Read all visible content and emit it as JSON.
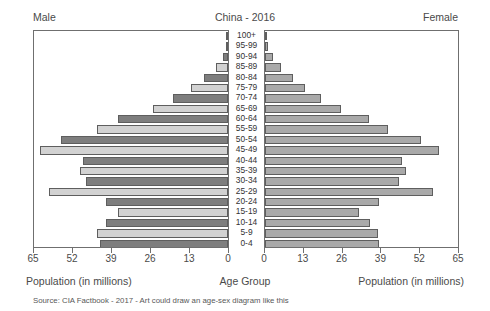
{
  "header": {
    "male_label": "Male",
    "title": "China - 2016",
    "female_label": "Female"
  },
  "captions": {
    "male_axis": "Population (in millions)",
    "center_axis": "Age Group",
    "female_axis": "Population (in millions)"
  },
  "source_note": "Source: CIA Factbook - 2017 - Art could draw an age-sex diagram like this",
  "colors": {
    "bar_dark": "#7e7e7e",
    "bar_light": "#d2d2d2",
    "bar_female": "#a9a9a9",
    "bar_outline": "#5e5e5e",
    "panel_border": "#6f6f6f",
    "text": "#4a4a4a",
    "background": "#ffffff"
  },
  "chart_data": {
    "type": "bar",
    "subtype": "population-pyramid",
    "title": "China - 2016",
    "xlabel": "Population (in millions)",
    "ylabel": "Age Group",
    "grid": false,
    "legend": "none",
    "xlim_left": [
      65,
      0
    ],
    "xlim_right": [
      0,
      65
    ],
    "xticks_left": [
      65,
      52,
      39,
      26,
      13,
      0
    ],
    "xticks_right": [
      0,
      13,
      26,
      39,
      52,
      65
    ],
    "categories": [
      "100+",
      "95-99",
      "90-94",
      "85-89",
      "80-84",
      "75-79",
      "70-74",
      "65-69",
      "60-64",
      "55-59",
      "50-54",
      "45-49",
      "40-44",
      "35-39",
      "30-34",
      "25-29",
      "20-24",
      "15-19",
      "10-14",
      "5-9",
      "0-4"
    ],
    "series": [
      {
        "name": "Male",
        "side": "left",
        "units": "millions",
        "values": [
          0.1,
          0.5,
          1.6,
          4.1,
          8.0,
          12.3,
          18.5,
          25.2,
          37.0,
          44.0,
          56.0,
          63.0,
          48.5,
          49.5,
          47.5,
          60.0,
          41.0,
          37.0,
          41.0,
          44.0,
          43.0
        ]
      },
      {
        "name": "Female",
        "side": "right",
        "units": "millions",
        "values": [
          0.2,
          0.9,
          2.6,
          5.5,
          9.5,
          13.5,
          19.0,
          25.5,
          35.0,
          41.5,
          52.5,
          58.5,
          46.0,
          47.5,
          45.0,
          56.5,
          38.5,
          31.5,
          35.5,
          38.0,
          38.5
        ]
      }
    ]
  }
}
